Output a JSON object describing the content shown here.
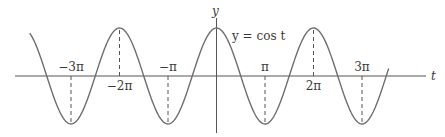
{
  "chart_data": {
    "type": "line",
    "title": "",
    "xlabel": "t",
    "ylabel": "y",
    "curve_label": "y = cos t",
    "function": "cos",
    "x_range_radians": [
      -3.85,
      3.55
    ],
    "y_range": [
      -1,
      1
    ],
    "grid": false,
    "tick_labels": [
      {
        "value": -3,
        "label": "−3π",
        "position": "above"
      },
      {
        "value": -2,
        "label": "−2π",
        "position": "below"
      },
      {
        "value": -1,
        "label": "−π",
        "position": "above"
      },
      {
        "value": 1,
        "label": "π",
        "position": "above"
      },
      {
        "value": 2,
        "label": "2π",
        "position": "below"
      },
      {
        "value": 3,
        "label": "3π",
        "position": "above"
      }
    ],
    "dashed_guides_at_multiples_of_pi": [
      -3,
      -2,
      -1,
      1,
      2,
      3
    ],
    "series": [
      {
        "name": "y = cos t",
        "x_pi_multiples": [
          -3,
          -2,
          -1,
          0,
          1,
          2,
          3
        ],
        "values": [
          -1,
          1,
          -1,
          1,
          -1,
          1,
          -1
        ]
      }
    ]
  },
  "axes": {
    "x_label": "t",
    "y_label": "y"
  },
  "colors": {
    "curve": "#6e6e6e",
    "axis": "#555555",
    "text": "#3a3a3a"
  }
}
